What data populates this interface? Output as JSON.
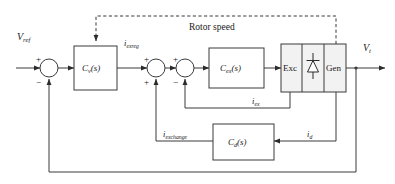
{
  "figure": {
    "kind": "control-block-diagram",
    "background_color": "#ffffff",
    "line_color": "#3a3a3a",
    "block_fill": "#f2f2f2",
    "text_color": "#1a1a1a"
  },
  "signals": {
    "v_ref": {
      "base": "V",
      "sub": "ref",
      "label": "V_ref"
    },
    "i_exreg": {
      "base": "i",
      "sub": "exreg",
      "label": "i_exreg"
    },
    "v_t": {
      "base": "V",
      "sub": "t",
      "label": "V_t"
    },
    "i_ex": {
      "base": "i",
      "sub": "ex",
      "label": "i_ex"
    },
    "i_d": {
      "base": "i",
      "sub": "d",
      "label": "i_d"
    },
    "i_exchange": {
      "base": "i",
      "sub": "exchange",
      "label": "i_exchange"
    },
    "rotor_speed": {
      "label": "Rotor speed"
    }
  },
  "blocks": [
    {
      "id": "cv",
      "base": "C",
      "sub": "v",
      "suffix": "(s)",
      "label": "C_v(s)"
    },
    {
      "id": "cex",
      "base": "C",
      "sub": "ex",
      "suffix": "(s)",
      "label": "C_ex(s)"
    },
    {
      "id": "cd",
      "base": "C",
      "sub": "d",
      "suffix": "(s)",
      "label": "C_d(s)"
    },
    {
      "id": "exc",
      "label": "Exc"
    },
    {
      "id": "gen",
      "label": "Gen"
    },
    {
      "id": "rectifier",
      "label": "diode-rectifier"
    }
  ],
  "summing_junctions": [
    {
      "id": "sum1",
      "signs": {
        "left": "+",
        "bottom": "−"
      }
    },
    {
      "id": "sum2",
      "signs": {
        "left": "+",
        "bottom": "+"
      }
    },
    {
      "id": "sum3",
      "signs": {
        "left": "+",
        "bottom": "−"
      }
    }
  ],
  "signs": {
    "plus": "+",
    "minus": "−"
  },
  "icons": {
    "diode": "diode-icon",
    "arrow": "arrowhead-icon"
  }
}
